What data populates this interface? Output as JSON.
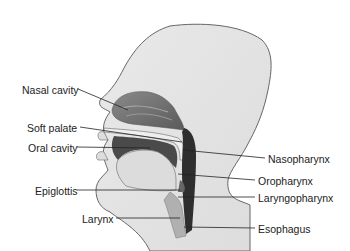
{
  "figure": {
    "labels_left": [
      {
        "text": "Nasal cavity",
        "x": 22,
        "y": 84
      },
      {
        "text": "Soft palate",
        "x": 27,
        "y": 122
      },
      {
        "text": "Oral cavity",
        "x": 28,
        "y": 142
      },
      {
        "text": "Epiglottis",
        "x": 35,
        "y": 185
      },
      {
        "text": "Larynx",
        "x": 82,
        "y": 213
      }
    ],
    "labels_right": [
      {
        "text": "Nasopharynx",
        "x": 268,
        "y": 153
      },
      {
        "text": "Oropharynx",
        "x": 258,
        "y": 175
      },
      {
        "text": "Laryngopharynx",
        "x": 258,
        "y": 192
      },
      {
        "text": "Esophagus",
        "x": 258,
        "y": 223
      }
    ]
  }
}
